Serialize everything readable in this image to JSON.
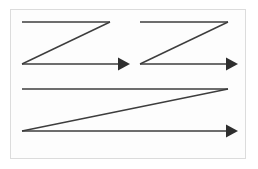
{
  "figure": {
    "background_color": "#ffffff",
    "frame": {
      "name": "image-border",
      "stroke_color": "#dcdcdc",
      "fill_color": "#fdfdfd",
      "x": 10,
      "y": 9,
      "width": 236,
      "height": 150
    },
    "stroke_color": "#3d3d3d",
    "stroke_width": 1.4,
    "arrow_fill": "#2e2e2e",
    "paths": [
      {
        "name": "scan-path-top-left",
        "label": "",
        "top_line": {
          "x1": 22,
          "y": 22,
          "x2": 110
        },
        "diagonal": {
          "x1": 110,
          "y1": 22,
          "x2": 22,
          "y2": 64
        },
        "bottom_line": {
          "x1": 22,
          "y": 64,
          "x2": 118
        },
        "arrow": {
          "tip_x": 130,
          "y": 64,
          "half_height": 6.5,
          "length": 12
        }
      },
      {
        "name": "scan-path-top-right",
        "label": "",
        "top_line": {
          "x1": 140,
          "y": 22,
          "x2": 228
        },
        "diagonal": {
          "x1": 228,
          "y1": 22,
          "x2": 140,
          "y2": 64
        },
        "bottom_line": {
          "x1": 140,
          "y": 64,
          "x2": 226
        },
        "arrow": {
          "tip_x": 238,
          "y": 64,
          "half_height": 6.5,
          "length": 12
        }
      },
      {
        "name": "scan-path-bottom-wide",
        "label": "",
        "top_line": {
          "x1": 22,
          "y": 89,
          "x2": 228
        },
        "diagonal": {
          "x1": 228,
          "y1": 89,
          "x2": 22,
          "y2": 131
        },
        "bottom_line": {
          "x1": 22,
          "y": 131,
          "x2": 226
        },
        "arrow": {
          "tip_x": 238,
          "y": 131,
          "half_height": 6.5,
          "length": 12
        }
      }
    ]
  }
}
